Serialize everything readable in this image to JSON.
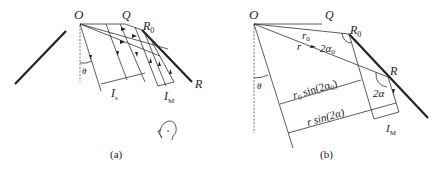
{
  "figure_a": {
    "caption": "(a)",
    "labels": {
      "O": "O",
      "Q": "Q",
      "R0_main": "R",
      "R0_sub": "0",
      "R": "R",
      "theta": "θ",
      "Is_main": "I",
      "Is_sub": "s",
      "IM_main": "I",
      "IM_sub": "M"
    },
    "observer": "observer-head"
  },
  "figure_b": {
    "caption": "(b)",
    "labels": {
      "O": "O",
      "Q": "Q",
      "R0_main": "R",
      "R0_sub": "0",
      "R": "R",
      "theta": "θ",
      "r0_main": "r",
      "r0_sub": "0",
      "r": "r",
      "angle_2a0_main": "2α",
      "angle_2a0_sub": "0",
      "angle_2a": "2α",
      "r0sin_prefix_main": "r",
      "r0sin_prefix_sub": "0",
      "r0sin_text": " sin(2α",
      "r0sin_sub": "0",
      "r0sin_close": ")",
      "rsin_text": "r sin(2α)",
      "IM_main": "I",
      "IM_sub": "M"
    }
  }
}
